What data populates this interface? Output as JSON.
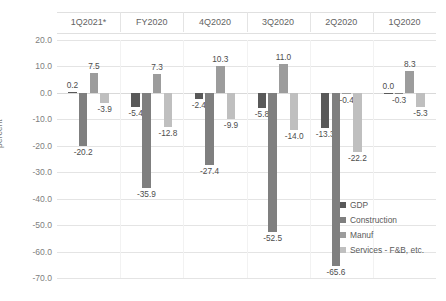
{
  "chart_data": {
    "type": "bar",
    "title": "",
    "subtitle": "",
    "xlabel": "",
    "ylabel": "percent",
    "ylim": [
      -70,
      20
    ],
    "ytick_step": 10,
    "grid": true,
    "legend_position": "bottom-right",
    "category_axis_position": "top",
    "categories": [
      "1Q2021*",
      "FY2020",
      "4Q2020",
      "3Q2020",
      "2Q2020",
      "1Q2020"
    ],
    "ytick_labels": [
      "20.0",
      "10.0",
      "0.0",
      "-10.0",
      "-20.0",
      "-30.0",
      "-40.0",
      "-50.0",
      "-60.0",
      "-70.0"
    ],
    "ytick_values": [
      20,
      10,
      0,
      -10,
      -20,
      -30,
      -40,
      -50,
      -60,
      -70
    ],
    "series": [
      {
        "name": "GDP",
        "color": "#595959",
        "values": [
          0.2,
          -5.4,
          -2.4,
          -5.8,
          -13.3,
          0.0
        ],
        "labels": [
          "0.2",
          "-5.4",
          "-2.4",
          "-5.8",
          "-13.3",
          "0.0"
        ]
      },
      {
        "name": "Construction",
        "color": "#7f7f7f",
        "values": [
          -20.2,
          -35.9,
          -27.4,
          -52.5,
          -65.6,
          -0.3
        ],
        "labels": [
          "-20.2",
          "-35.9",
          "-27.4",
          "-52.5",
          "-65.6",
          "-0.3"
        ]
      },
      {
        "name": "Manuf",
        "color": "#9c9c9c",
        "values": [
          7.5,
          7.3,
          10.3,
          11.0,
          -0.4,
          8.3
        ],
        "labels": [
          "7.5",
          "7.3",
          "10.3",
          "11.0",
          "-0.4",
          "8.3"
        ]
      },
      {
        "name": "Services - F&B, etc.",
        "color": "#bfbfbf",
        "values": [
          -3.9,
          -12.8,
          -9.9,
          -14.0,
          -22.2,
          -5.3
        ],
        "labels": [
          "-3.9",
          "-12.8",
          "-9.9",
          "-14.0",
          "-22.2",
          "-5.3"
        ]
      }
    ]
  }
}
